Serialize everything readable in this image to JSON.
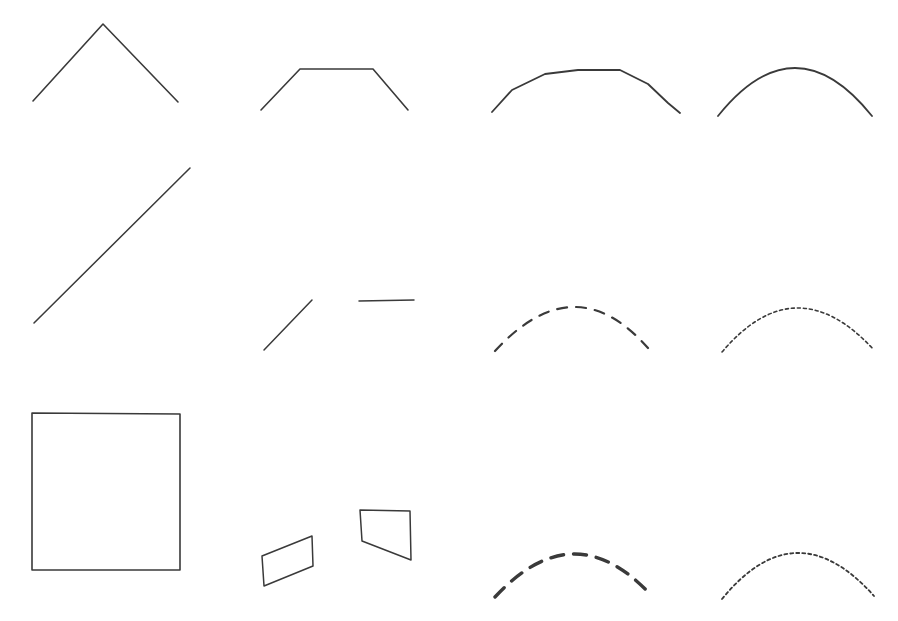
{
  "figure": {
    "width": 898,
    "height": 621,
    "background": "#ffffff",
    "stroke_color": "#3a3a3a",
    "stroke_color_light": "#55555a",
    "panels": [
      {
        "id": "r1c1",
        "name": "chevron-two-segment",
        "row": 1,
        "column": 1,
        "kind": "polyline",
        "stroke_width": 1.6,
        "dash": "none",
        "points": [
          [
            33,
            101
          ],
          [
            103,
            24
          ],
          [
            178,
            102
          ]
        ]
      },
      {
        "id": "r1c2",
        "name": "trapezoid-arch-four-segment",
        "row": 1,
        "column": 2,
        "kind": "polyline",
        "stroke_width": 1.6,
        "dash": "none",
        "points": [
          [
            261,
            110
          ],
          [
            300,
            69
          ],
          [
            373,
            69
          ],
          [
            408,
            110
          ]
        ]
      },
      {
        "id": "r1c3",
        "name": "arch-six-segment",
        "row": 1,
        "column": 3,
        "kind": "polyline",
        "stroke_width": 1.8,
        "dash": "none",
        "points": [
          [
            492,
            112
          ],
          [
            512,
            90
          ],
          [
            545,
            74
          ],
          [
            578,
            70
          ],
          [
            620,
            70
          ],
          [
            648,
            84
          ],
          [
            668,
            103
          ],
          [
            680,
            113
          ]
        ]
      },
      {
        "id": "r1c4",
        "name": "smooth-arc",
        "row": 1,
        "column": 4,
        "kind": "arc",
        "stroke_width": 1.8,
        "dash": "none",
        "start": [
          718,
          116
        ],
        "peak": [
          795,
          68
        ],
        "end": [
          872,
          116
        ]
      },
      {
        "id": "r2c1",
        "name": "single-diagonal-line",
        "row": 2,
        "column": 1,
        "kind": "polyline",
        "stroke_width": 1.5,
        "dash": "none",
        "points": [
          [
            34,
            323
          ],
          [
            190,
            168
          ]
        ]
      },
      {
        "id": "r2c2",
        "name": "two-disjoint-segments",
        "row": 2,
        "column": 2,
        "kind": "segments",
        "stroke_width": 1.5,
        "dash": "none",
        "segments": [
          [
            [
              264,
              350
            ],
            [
              312,
              300
            ]
          ],
          [
            [
              359,
              301
            ],
            [
              414,
              300
            ]
          ]
        ]
      },
      {
        "id": "r2c3",
        "name": "dashed-arc-medium",
        "row": 2,
        "column": 3,
        "kind": "arc",
        "stroke_width": 2.2,
        "dash": "10 9",
        "start": [
          495,
          351
        ],
        "peak": [
          573,
          307
        ],
        "end": [
          648,
          348
        ]
      },
      {
        "id": "r2c4",
        "name": "dotted-arc-fine",
        "row": 2,
        "column": 4,
        "kind": "arc",
        "stroke_width": 1.6,
        "dash": "3 3",
        "start": [
          722,
          352
        ],
        "peak": [
          797,
          308
        ],
        "end": [
          874,
          350
        ]
      },
      {
        "id": "r3c1",
        "name": "square-outline",
        "row": 3,
        "column": 1,
        "kind": "polygon",
        "stroke_width": 1.6,
        "dash": "none",
        "points": [
          [
            32,
            413
          ],
          [
            180,
            414
          ],
          [
            180,
            570
          ],
          [
            32,
            570
          ]
        ]
      },
      {
        "id": "r3c2",
        "name": "two-parallelograms",
        "row": 3,
        "column": 2,
        "kind": "polygons",
        "stroke_width": 1.5,
        "dash": "none",
        "polygons": [
          [
            [
              262,
              556
            ],
            [
              312,
              536
            ],
            [
              313,
              566
            ],
            [
              264,
              586
            ]
          ],
          [
            [
              360,
              510
            ],
            [
              410,
              511
            ],
            [
              411,
              560
            ],
            [
              362,
              541
            ]
          ]
        ]
      },
      {
        "id": "r3c3",
        "name": "dashed-arc-thick",
        "row": 3,
        "column": 3,
        "kind": "arc",
        "stroke_width": 3.4,
        "dash": "13 10",
        "start": [
          495,
          597
        ],
        "peak": [
          573,
          554
        ],
        "end": [
          650,
          594
        ]
      },
      {
        "id": "r3c4",
        "name": "dotted-arc-fine-lower",
        "row": 3,
        "column": 4,
        "kind": "arc",
        "stroke_width": 1.8,
        "dash": "3 3",
        "start": [
          722,
          599
        ],
        "peak": [
          797,
          553
        ],
        "end": [
          874,
          596
        ]
      }
    ]
  }
}
